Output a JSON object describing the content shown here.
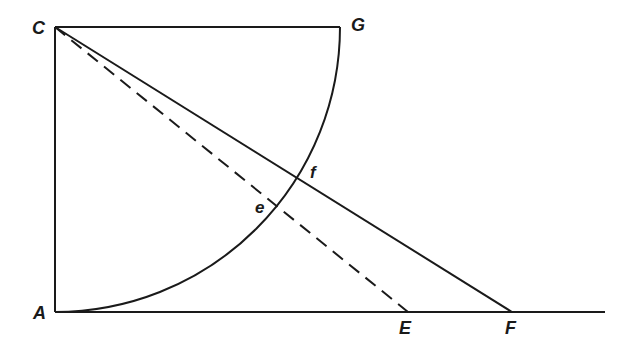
{
  "diagram": {
    "type": "geometric-construction",
    "stroke_color": "#1a1a1a",
    "background": "#ffffff",
    "points": {
      "C": {
        "label": "C",
        "x": 55,
        "y": 27
      },
      "G": {
        "label": "G",
        "x": 340,
        "y": 27
      },
      "A": {
        "label": "A",
        "x": 55,
        "y": 312
      },
      "E": {
        "label": "E",
        "x": 408,
        "y": 312
      },
      "F": {
        "label": "F",
        "x": 512,
        "y": 312
      },
      "f": {
        "label": "f",
        "x": 300,
        "y": 178
      },
      "e": {
        "label": "e",
        "x": 276,
        "y": 207
      }
    },
    "segments": [
      {
        "from": "C",
        "to": "G",
        "style": "solid"
      },
      {
        "from": "C",
        "to": "A",
        "style": "solid"
      },
      {
        "from": "A",
        "to": "baseline-end",
        "style": "solid"
      },
      {
        "from": "C",
        "to": "F",
        "style": "solid"
      },
      {
        "from": "C",
        "to": "E",
        "style": "dashed"
      }
    ],
    "arcs": [
      {
        "center": "C",
        "radius": 285,
        "from": "A",
        "to": "G",
        "style": "solid"
      }
    ],
    "baseline_end_x": 605
  },
  "labels": {
    "C": "C",
    "G": "G",
    "A": "A",
    "E": "E",
    "F": "F",
    "f": "f",
    "e": "e"
  }
}
